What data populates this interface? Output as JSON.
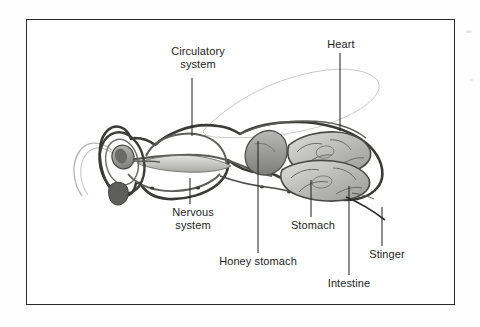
{
  "figure": {
    "frame_color": "#2a2a2a",
    "background_color": "#ffffff",
    "ink_color": "#1c1c1c",
    "organ_fill_light": "#d8d8d6",
    "organ_fill_mid": "#b4b4b2",
    "organ_fill_dark": "#8a8a88",
    "wing_color": "#bdbdbb"
  },
  "labels": {
    "circulatory_system": "Circulatory\nsystem",
    "heart": "Heart",
    "nervous_system": "Nervous\nsystem",
    "honey_stomach": "Honey stomach",
    "stomach": "Stomach",
    "stinger": "Stinger",
    "intestine": "Intestine"
  }
}
